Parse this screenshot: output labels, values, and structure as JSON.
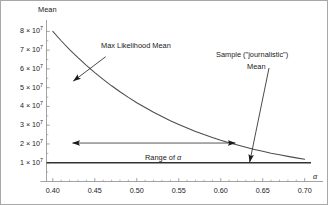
{
  "chart_data": {
    "type": "line",
    "title": "",
    "xlabel": "α",
    "ylabel": "Mean",
    "xlim": [
      0.3925,
      0.7075
    ],
    "ylim": [
      0,
      85000000
    ],
    "grid": false,
    "legend_position": "none",
    "xticks": [
      "0.40",
      "0.45",
      "0.50",
      "0.55",
      "0.60",
      "0.65",
      "0.70"
    ],
    "xtick_values": [
      0.4,
      0.45,
      0.5,
      0.55,
      0.6,
      0.65,
      0.7
    ],
    "xminor_step": 0.01,
    "yticks": [
      "1 × 10",
      "2 × 10",
      "3 × 10",
      "4 × 10",
      "5 × 10",
      "6 × 10",
      "7 × 10",
      "8 × 10"
    ],
    "ytick_values": [
      10000000,
      20000000,
      30000000,
      40000000,
      50000000,
      60000000,
      70000000,
      80000000
    ],
    "ytick_exponent": "7",
    "series": [
      {
        "name": "Max Likelihood Mean",
        "style": "curve",
        "x": [
          0.4,
          0.41,
          0.42,
          0.43,
          0.44,
          0.45,
          0.46,
          0.47,
          0.48,
          0.49,
          0.5,
          0.51,
          0.52,
          0.53,
          0.54,
          0.55,
          0.56,
          0.57,
          0.58,
          0.59,
          0.6,
          0.61,
          0.62,
          0.63,
          0.64,
          0.65,
          0.66,
          0.67,
          0.68,
          0.69,
          0.7
        ],
        "values": [
          80000000,
          75000000,
          70300000,
          66000000,
          61900000,
          58000000,
          54400000,
          51000000,
          47800000,
          44800000,
          42000000,
          39400000,
          36900000,
          34600000,
          32400000,
          30400000,
          28500000,
          26700000,
          25000000,
          23500000,
          22000000,
          20700000,
          19400000,
          18200000,
          17100000,
          16100000,
          15100000,
          14200000,
          13400000,
          12600000,
          11900000
        ]
      },
      {
        "name": "Sample (\"journalistic\") Mean",
        "style": "horizontal-line",
        "value": 10000000
      }
    ],
    "annotations": [
      {
        "name": "max-likelihood-mean",
        "text": "Max Likelihood Mean",
        "arrow_from": [
          0.463,
          66500000
        ],
        "arrow_to": [
          0.4245,
          53500000
        ]
      },
      {
        "name": "sample-journalistic-mean",
        "text_line1": "Sample (\"journalistic\")",
        "text_line2": "Mean",
        "arrow_from": [
          0.6575,
          60500000
        ],
        "arrow_to": [
          0.6345,
          10400000
        ]
      },
      {
        "name": "range-of-alpha",
        "text": "Range of α",
        "bar_y": 20500000,
        "bar_from": 0.4235,
        "bar_to": 0.6175,
        "double_headed": true
      }
    ]
  },
  "axis_labels": {
    "y_title": "Mean",
    "x_title": "α"
  },
  "annotation_text": {
    "max_likelihood": "Max Likelihood Mean",
    "sample_line1": "Sample (\"journalistic\")",
    "sample_line2": "Mean",
    "range_prefix": "Range of ",
    "range_symbol": "α"
  },
  "colors": {
    "curve": "#4d4d4d",
    "baseline": "#333333",
    "axis": "#8c8c8c",
    "annotation": "#1a1a1a",
    "frame": "#a8a8a8",
    "background": "#ffffff"
  }
}
